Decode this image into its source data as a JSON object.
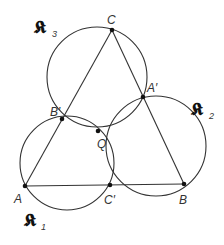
{
  "diagram": {
    "type": "geometry-miquel-theorem",
    "colors": {
      "stroke": "#333333",
      "point": "#111111",
      "background": "#ffffff"
    },
    "points": {
      "A": {
        "label": "A",
        "x": 25,
        "y": 186
      },
      "B": {
        "label": "B",
        "x": 184,
        "y": 184
      },
      "C": {
        "label": "C",
        "x": 112,
        "y": 30
      },
      "A_prime": {
        "label": "A′",
        "x": 143,
        "y": 97
      },
      "B_prime": {
        "label": "B′",
        "x": 62,
        "y": 119
      },
      "C_prime": {
        "label": "C′",
        "x": 110,
        "y": 185
      },
      "Q": {
        "label": "Q",
        "x": 98,
        "y": 131
      }
    },
    "circles": {
      "K1": {
        "label": "𝕶",
        "subscript": "1",
        "cx": 67,
        "cy": 163,
        "r": 47
      },
      "K2": {
        "label": "𝕶",
        "subscript": "2",
        "cx": 156,
        "cy": 146,
        "r": 50
      },
      "K3": {
        "label": "𝕶",
        "subscript": "3",
        "cx": 97,
        "cy": 77,
        "r": 50
      }
    },
    "triangle": [
      "A",
      "B",
      "C"
    ]
  }
}
